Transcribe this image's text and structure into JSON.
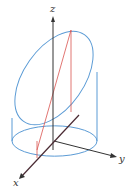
{
  "diagram": {
    "axes": {
      "x_label": "x",
      "y_label": "y",
      "z_label": "z"
    },
    "colors": {
      "cylinder": "#5b9bd5",
      "plane_lines": "#d9534f",
      "axes": "#333333",
      "background": "#ffffff"
    }
  }
}
